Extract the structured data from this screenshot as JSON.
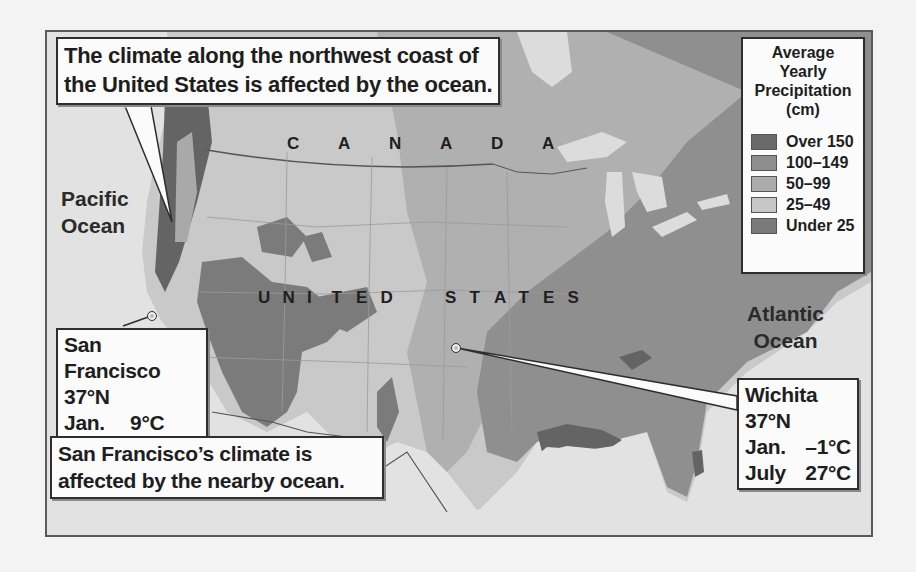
{
  "map": {
    "title_callout": "The climate along the northwest coast of the United States is affected by the ocean.",
    "title_lines": [
      "The climate along the northwest coast of",
      "the United States is affected by the ocean."
    ],
    "countries": {
      "canada": [
        "C",
        "A",
        "N",
        "A",
        "D",
        "A"
      ],
      "usa_word1": [
        "U",
        "N",
        "I",
        "T",
        "E",
        "D"
      ],
      "usa_word2": [
        "S",
        "T",
        "A",
        "T",
        "E",
        "S"
      ]
    },
    "oceans": {
      "pacific": [
        "Pacific",
        "Ocean"
      ],
      "atlantic": [
        "Atlantic",
        "Ocean"
      ]
    },
    "cities": [
      {
        "name": "San Francisco",
        "latitude": "37°N",
        "jan_label": "Jan.",
        "jan_temp": "9°C",
        "july_label": "July",
        "july_temp": "16°C"
      },
      {
        "name": "Wichita",
        "latitude": "37°N",
        "jan_label": "Jan.",
        "jan_temp": "–1°C",
        "july_label": "July",
        "july_temp": "27°C"
      }
    ],
    "sf_note_lines": [
      "San Francisco’s climate is",
      "affected by the nearby ocean."
    ],
    "legend": {
      "title_lines": [
        "Average",
        "Yearly",
        "Precipitation",
        "(cm)"
      ],
      "items": [
        {
          "label": "Over 150",
          "color": "#6a6a6a"
        },
        {
          "label": "100–149",
          "color": "#8d8d8d"
        },
        {
          "label": "50–99",
          "color": "#ababab"
        },
        {
          "label": "25–49",
          "color": "#c6c6c6"
        },
        {
          "label": "Under 25",
          "color": "#7a7a7a"
        }
      ]
    },
    "colors": {
      "ocean": "#e4e4e4",
      "over150": "#6a6a6a",
      "r100_149": "#8d8d8d",
      "r50_99": "#ababab",
      "r25_49": "#c6c6c6",
      "under25": "#7a7a7a",
      "border": "#5a5a5a"
    }
  }
}
